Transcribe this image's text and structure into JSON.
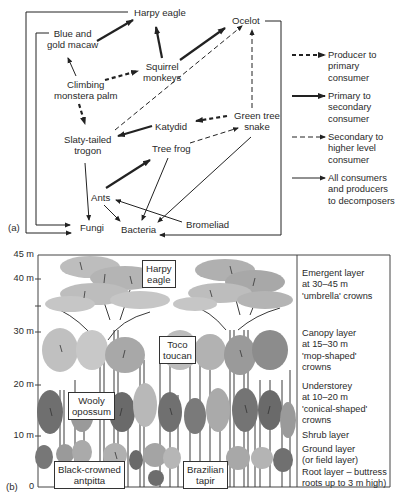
{
  "panel_a": {
    "tag": "(a)",
    "nodes": {
      "harpy_eagle": "Harpy eagle",
      "ocelot": "Ocelot",
      "macaw_1": "Blue and",
      "macaw_2": "gold macaw",
      "squirrel_1": "Squirrel",
      "squirrel_2": "monkeys",
      "palm_1": "Climbing",
      "palm_2": "monstera palm",
      "snake_1": "Green tree",
      "snake_2": "snake",
      "katydid": "Katydid",
      "trogon_1": "Slaty-tailed",
      "trogon_2": "trogon",
      "tree_frog": "Tree frog",
      "ants": "Ants",
      "fungi": "Fungi",
      "bacteria": "Bacteria",
      "bromeliad": "Bromeliad"
    },
    "legend": [
      {
        "style": "thick-dashed",
        "line1": "Producer to",
        "line2": "primary",
        "line3": "consumer"
      },
      {
        "style": "thick-solid",
        "line1": "Primary to",
        "line2": "secondary",
        "line3": "consumer"
      },
      {
        "style": "thin-dashed",
        "line1": "Secondary to",
        "line2": "higher level",
        "line3": "consumer"
      },
      {
        "style": "thin-solid",
        "line1": "All consumers",
        "line2": "and producers",
        "line3": "to decomposers"
      }
    ]
  },
  "panel_b": {
    "tag": "(b)",
    "y_axis": [
      "45 m",
      "40 m",
      "30 m",
      "20 m",
      "10 m",
      "0"
    ],
    "animals": {
      "harpy_1": "Harpy",
      "harpy_2": "eagle",
      "toco_1": "Toco",
      "toco_2": "toucan",
      "opossum_1": "Wooly",
      "opossum_2": "opossum",
      "antpitta_1": "Black-crowned",
      "antpitta_2": "antpitta",
      "tapir_1": "Brazilian",
      "tapir_2": "tapir"
    },
    "layers": {
      "emergent": [
        "Emergent layer",
        "at 30–45 m",
        "'umbrella' crowns"
      ],
      "canopy": [
        "Canopy layer",
        "at 15–30 m",
        "'mop-shaped'",
        "crowns"
      ],
      "understorey": [
        "Understorey",
        "at 10–20 m",
        "'conical-shaped'",
        "crowns"
      ],
      "shrub": [
        "Shrub layer"
      ],
      "ground": [
        "Ground layer",
        "(or field layer)",
        "Root layer – buttress",
        "roots up to 3 m high)"
      ]
    },
    "colors": {
      "light_crown": "#bdbdbd",
      "mid_crown": "#a3a3a3",
      "dark_crown": "#6f6f6f",
      "trunk": "#3a3a3a"
    }
  }
}
